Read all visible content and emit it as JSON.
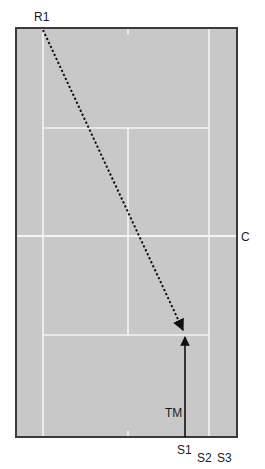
{
  "diagram": {
    "type": "tennis-court-tactic",
    "colors": {
      "court_surface": "#c8c8c8",
      "court_border": "#3a3a3a",
      "court_lines": "#f4f4f4",
      "path_color": "#111111",
      "label_color": "#1a1a1a"
    },
    "labels": {
      "receiver": "R1",
      "center": "C",
      "target_marker": "TM",
      "server_position_1": "S1",
      "server_position_2": "S2",
      "server_position_3": "S3"
    },
    "paths": [
      {
        "id": "return-path",
        "from": "R1",
        "to": "TM-zone",
        "style": "dotted",
        "arrowhead": true
      },
      {
        "id": "approach-path",
        "from": "S1",
        "to": "TM-zone",
        "style": "solid",
        "arrowhead": true
      }
    ]
  }
}
